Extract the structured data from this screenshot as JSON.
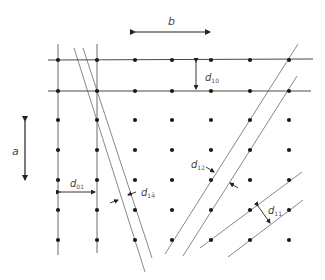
{
  "diagram": {
    "colors": {
      "line": "#333333",
      "point": "#1a1a1a",
      "text": "#444444",
      "background": "#ffffff"
    },
    "lattice": {
      "columns_x": [
        58,
        97,
        135,
        172,
        211,
        250,
        289
      ],
      "rows_y": [
        60,
        91,
        120,
        150,
        180,
        210,
        240
      ]
    },
    "vectors": {
      "a": {
        "label": "a",
        "direction": "vertical"
      },
      "b": {
        "label": "b",
        "direction": "horizontal"
      }
    },
    "spacings": [
      {
        "id": "d10",
        "symbol": "d",
        "subscript": "10"
      },
      {
        "id": "d01",
        "symbol": "d",
        "subscript": "01"
      },
      {
        "id": "d14bar",
        "symbol": "d",
        "subscript": "14̄"
      },
      {
        "id": "d12",
        "symbol": "d",
        "subscript": "12"
      },
      {
        "id": "d11",
        "symbol": "d",
        "subscript": "11"
      }
    ]
  }
}
